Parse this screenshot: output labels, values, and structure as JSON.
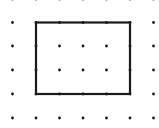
{
  "diagram": {
    "type": "dot-grid-rectangle",
    "grid": {
      "columns_x": [
        12.5,
        36,
        59.5,
        83,
        106.5,
        130,
        153.5
      ],
      "rows_y": [
        -1,
        22.5,
        46,
        70,
        94,
        118
      ],
      "dot_radius": 1.4,
      "dot_color": "#1a1a1a"
    },
    "rectangle": {
      "x": 36,
      "y": 22.5,
      "width": 94,
      "height": 71.5,
      "stroke": "#1a1a1a",
      "stroke_width": 2.2,
      "grid_width_units": 4,
      "grid_height_units": 3
    }
  }
}
